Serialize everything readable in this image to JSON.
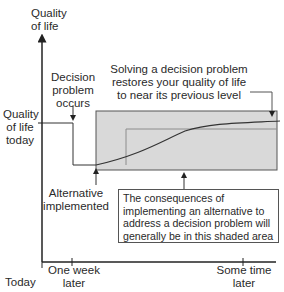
{
  "axes": {
    "y_label_line1": "Quality",
    "y_label_line2": "of life",
    "y_tick_label_line1": "Quality",
    "y_tick_label_line2": "of life",
    "y_tick_label_line3": "today",
    "x_ticks": [
      {
        "line1": "",
        "line2": "Today"
      },
      {
        "line1": "One week",
        "line2": "later"
      },
      {
        "line1": "Some time",
        "line2": "later"
      }
    ]
  },
  "annotations": {
    "decision_problem": {
      "line1": "Decision",
      "line2": "problem",
      "line3": "occurs"
    },
    "solving": {
      "line1": "Solving a decision problem",
      "line2": "restores your quality of life",
      "line3": "to near its previous level"
    },
    "alternative": {
      "line1": "Alternative",
      "line2": "implemented"
    },
    "consequences": "The consequences of implementing an alternative to address a decision problem will generally be in this shaded area"
  },
  "colors": {
    "shaded_area": "#d9d9d9",
    "lines": "#333333",
    "light_line": "#8c8c8c"
  }
}
